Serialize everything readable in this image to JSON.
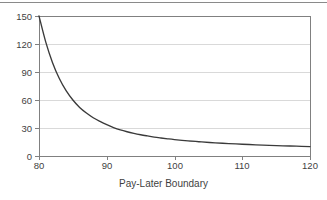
{
  "chart_data": {
    "type": "line",
    "title": "",
    "subtitle": "",
    "xlabel": "Pay-Later Boundary",
    "ylabel": "",
    "xlim": [
      80,
      120
    ],
    "ylim": [
      0,
      150
    ],
    "grid": true,
    "legend": null,
    "xticks": [
      "80",
      "90",
      "100",
      "110",
      "120"
    ],
    "xtick_values": [
      80,
      90,
      100,
      110,
      120
    ],
    "yticks": [
      "0",
      "30",
      "60",
      "90",
      "120",
      "150"
    ],
    "ytick_values": [
      0,
      30,
      60,
      90,
      120,
      150
    ],
    "series": [
      {
        "name": "curve",
        "color": "#3a3a3a",
        "x": [
          80,
          81,
          82,
          83,
          84,
          85,
          86,
          87,
          88,
          89,
          90,
          91,
          92,
          93,
          94,
          95,
          96,
          97,
          98,
          99,
          100,
          102,
          104,
          106,
          108,
          110,
          112,
          114,
          116,
          118,
          120
        ],
        "values": [
          150,
          122,
          100,
          83,
          70,
          60,
          52,
          46,
          41,
          37,
          33.5,
          30.5,
          28,
          26,
          24.3,
          22.8,
          21.5,
          20.3,
          19.3,
          18.4,
          17.6,
          16.2,
          15.1,
          14.1,
          13.3,
          12.6,
          12.0,
          11.4,
          10.9,
          10.5,
          10.1
        ]
      }
    ]
  },
  "axes": {
    "x_title": "Pay-Later Boundary"
  },
  "style": {
    "curve_color": "#3a3a3a",
    "grid_color": "#d9d9d9",
    "axis_color": "#808080",
    "rule_color": "#8a8a8a",
    "text_color": "#3f3f3f",
    "background": "#ffffff"
  }
}
